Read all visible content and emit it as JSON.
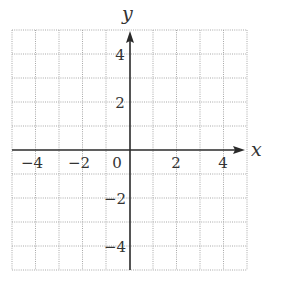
{
  "chart_data": {
    "type": "coordinate-grid",
    "title": "",
    "xlabel": "x",
    "ylabel": "y",
    "xlim": [
      -5,
      5
    ],
    "ylim": [
      -5,
      5
    ],
    "grid": true,
    "grid_style": "dotted",
    "grid_step": 1,
    "x_tick_labels": [
      {
        "value": -4,
        "label": "−4"
      },
      {
        "value": -2,
        "label": "−2"
      },
      {
        "value": 0,
        "label": "0"
      },
      {
        "value": 2,
        "label": "2"
      },
      {
        "value": 4,
        "label": "4"
      }
    ],
    "y_tick_labels": [
      {
        "value": 4,
        "label": "4"
      },
      {
        "value": 2,
        "label": "2"
      },
      {
        "value": -2,
        "label": "−2"
      },
      {
        "value": -4,
        "label": "−4"
      }
    ],
    "series": [],
    "colors": {
      "grid": "#a8a8a8",
      "axis": "#2a2a2a",
      "text": "#333333"
    }
  },
  "labels": {
    "x_axis": "x",
    "y_axis": "y",
    "origin": "0",
    "x_neg4": "−4",
    "x_neg2": "−2",
    "x_pos2": "2",
    "x_pos4": "4",
    "y_pos4": "4",
    "y_pos2": "2",
    "y_neg2": "−2",
    "y_neg4": "−4"
  }
}
